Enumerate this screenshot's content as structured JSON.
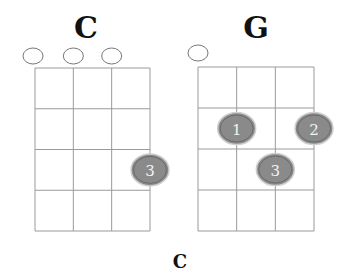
{
  "chords": [
    {
      "name": "C",
      "strings": 4,
      "frets": 4,
      "open_strings": [
        1,
        2,
        3
      ],
      "fingers": [
        {
          "string": 4,
          "fret": 3,
          "finger": "3"
        }
      ]
    },
    {
      "name": "G",
      "strings": 4,
      "frets": 4,
      "open_strings": [
        1
      ],
      "fingers": [
        {
          "string": 2,
          "fret": 2,
          "finger": "1"
        },
        {
          "string": 4,
          "fret": 2,
          "finger": "2"
        },
        {
          "string": 3,
          "fret": 3,
          "finger": "3"
        }
      ]
    }
  ],
  "caption": "C"
}
